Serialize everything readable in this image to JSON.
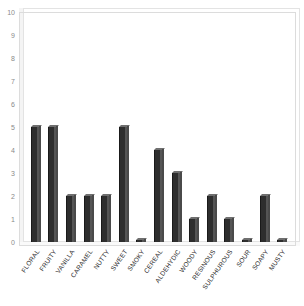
{
  "chart_data": {
    "type": "bar",
    "title": "",
    "subtitle": "",
    "xlabel": "",
    "ylabel": "",
    "ylim": [
      0,
      10
    ],
    "yticks": [
      0,
      1,
      2,
      3,
      4,
      5,
      6,
      7,
      8,
      9,
      10
    ],
    "grid": false,
    "legend": null,
    "categories": [
      "FLORAL",
      "FRUITY",
      "VANILLA",
      "CARAMEL",
      "NUTTY",
      "SWEET",
      "SMOKY",
      "CEREAL",
      "ALDEHYDIC",
      "WOODY",
      "RESINOUS",
      "SULPHUROUS",
      "SOUR",
      "SOAPY",
      "MUSTY"
    ],
    "values": [
      5,
      5,
      2,
      2,
      2,
      5,
      0.1,
      4,
      3,
      1,
      2,
      1,
      0.1,
      2,
      0.1
    ],
    "bar_color": "#2e2e2e",
    "frame_color": "#dcdcdc",
    "tick_color": "#8a8a8a"
  },
  "top_crop_artifact": "              "
}
